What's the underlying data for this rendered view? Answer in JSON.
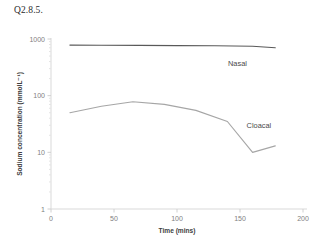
{
  "figure": {
    "caption": "Q2.8.5."
  },
  "chart_data": {
    "type": "line",
    "title": "",
    "subtitle": "",
    "xlabel": "Time (mins)",
    "ylabel": "Sodium concentration (mmolL⁻¹)",
    "yscale": "log",
    "xscale": "linear",
    "xlim": [
      0,
      200
    ],
    "ylim": [
      1,
      1000
    ],
    "xticks": [
      0,
      50,
      100,
      150,
      200
    ],
    "xtick_labels": [
      "0",
      "50",
      "100",
      "150",
      "200"
    ],
    "yticks": [
      1,
      10,
      100,
      1000
    ],
    "ytick_labels": [
      "1",
      "10",
      "100",
      "1000"
    ],
    "y_minor_ticks": true,
    "grid": false,
    "legend_position": "inline-annotation",
    "series": [
      {
        "name": "Nasal",
        "color": "#595959",
        "label_x": 148,
        "label_y": 330,
        "x": [
          15,
          40,
          70,
          100,
          130,
          160,
          178
        ],
        "values": [
          780,
          775,
          770,
          765,
          760,
          745,
          700
        ]
      },
      {
        "name": "Cloacal",
        "color": "#a6a6a6",
        "label_x": 165,
        "label_y": 27,
        "x": [
          15,
          40,
          65,
          90,
          115,
          140,
          160,
          178
        ],
        "values": [
          50,
          65,
          78,
          70,
          55,
          35,
          10,
          13
        ]
      }
    ],
    "annotations": [
      {
        "text": "Nasal",
        "x": 148,
        "y": 330
      },
      {
        "text": "Cloacal",
        "x": 165,
        "y": 27
      }
    ]
  }
}
